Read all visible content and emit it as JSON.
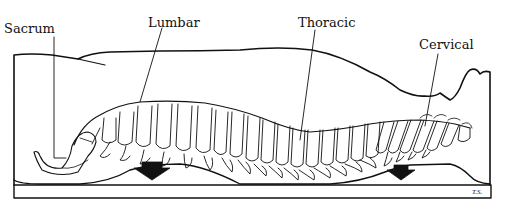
{
  "diagram": {
    "labels": [
      {
        "id": "sacrum",
        "text": "Sacrum"
      },
      {
        "id": "lumbar",
        "text": "Lumbar"
      },
      {
        "id": "thoracic",
        "text": "Thoracic"
      },
      {
        "id": "cervical",
        "text": "Cervical"
      }
    ],
    "arrows": [
      {
        "id": "arrow-lumbar",
        "direction": "down"
      },
      {
        "id": "arrow-cervical",
        "direction": "down"
      }
    ],
    "signature": "T.S.",
    "colors": {
      "line": "#111111",
      "background": "#ffffff"
    }
  }
}
